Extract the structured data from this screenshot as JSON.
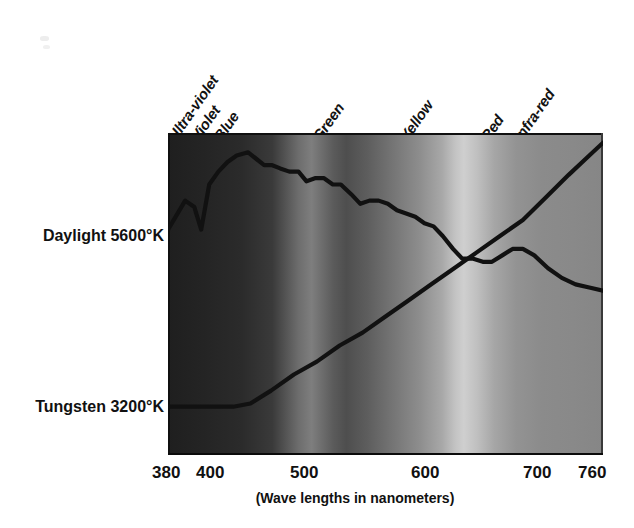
{
  "figure": {
    "caption": "(Wave lengths in nanometers)",
    "series_labels": [
      {
        "id": "daylight",
        "text": "Daylight 5600°K"
      },
      {
        "id": "tungsten",
        "text": "Tungsten 3200°K"
      }
    ],
    "band_labels": [
      {
        "id": "ultra-violet",
        "text": "Ultra-violet"
      },
      {
        "id": "violet",
        "text": "Violet"
      },
      {
        "id": "blue",
        "text": "Blue"
      },
      {
        "id": "green",
        "text": "Green"
      },
      {
        "id": "yellow",
        "text": "Yellow"
      },
      {
        "id": "red",
        "text": "Red"
      },
      {
        "id": "infra-red",
        "text": "Infra-red"
      }
    ],
    "xticks": [
      "380",
      "400",
      "500",
      "600",
      "700",
      "760"
    ]
  },
  "chart_data": {
    "type": "line",
    "title": "",
    "subtitle": "",
    "xlabel": "(Wave lengths in nanometers)",
    "ylabel": "",
    "xlim": [
      380,
      760
    ],
    "ylim": [
      0,
      100
    ],
    "grid": false,
    "legend_position": "left-axis-labels",
    "xtick_values": [
      380,
      400,
      500,
      600,
      700,
      760
    ],
    "annotations": [
      {
        "text": "Ultra-violet",
        "x": 392,
        "rotation": -55
      },
      {
        "text": "Violet",
        "x": 408,
        "rotation": -55
      },
      {
        "text": "Blue",
        "x": 425,
        "rotation": -55
      },
      {
        "text": "Green",
        "x": 510,
        "rotation": -55
      },
      {
        "text": "Yellow",
        "x": 585,
        "rotation": -55
      },
      {
        "text": "Red",
        "x": 655,
        "rotation": -55
      },
      {
        "text": "Infra-red",
        "x": 690,
        "rotation": -55
      }
    ],
    "series": [
      {
        "name": "Daylight 5600°K",
        "color": "#111111",
        "x": [
          380,
          395,
          403,
          409,
          416,
          424,
          432,
          440,
          450,
          457,
          464,
          471,
          478,
          486,
          494,
          501,
          509,
          516,
          524,
          531,
          540,
          548,
          556,
          564,
          572,
          580,
          588,
          596,
          604,
          612,
          620,
          629,
          637,
          646,
          655,
          663,
          672,
          681,
          690,
          700,
          712,
          724,
          736,
          748,
          760
        ],
        "y": [
          70,
          79,
          77,
          70,
          84,
          88,
          91,
          93,
          94,
          92,
          90,
          90,
          89,
          88,
          88,
          85,
          86,
          86,
          84,
          84,
          81,
          78,
          79,
          79,
          78,
          76,
          75,
          74,
          72,
          71,
          68,
          64,
          61,
          61,
          60,
          60,
          62,
          64,
          64,
          62,
          58,
          55,
          53,
          52,
          51
        ]
      },
      {
        "name": "Tungsten 3200°K",
        "color": "#111111",
        "x": [
          380,
          400,
          420,
          437,
          452,
          470,
          490,
          510,
          530,
          550,
          570,
          590,
          610,
          630,
          650,
          670,
          690,
          710,
          730,
          745,
          760
        ],
        "y": [
          15,
          15,
          15,
          15,
          16,
          20,
          25,
          29,
          34,
          38,
          43,
          48,
          53,
          58,
          63,
          68,
          73,
          80,
          87,
          92,
          97
        ]
      }
    ]
  }
}
